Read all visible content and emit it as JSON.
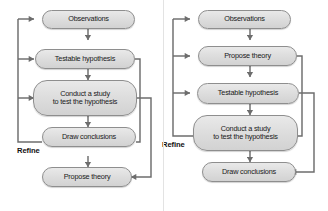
{
  "page": {
    "background_color": "#ffffff"
  },
  "style": {
    "node_fill": "#dedede",
    "node_border": "#8e8e8e",
    "edge_color": "#6d6d6d",
    "text_color": "#1a1a1a"
  },
  "diagrams": [
    {
      "id": "left",
      "name": "hypothesis-first-cycle",
      "refine_label": "Refine",
      "nodes": [
        {
          "id": "observations",
          "label": "Observations"
        },
        {
          "id": "testable",
          "label": "Testable hypothesis"
        },
        {
          "id": "conduct",
          "label": "Conduct a study\nto test the hypothesis"
        },
        {
          "id": "conclusions",
          "label": "Draw conclusions"
        },
        {
          "id": "propose",
          "label": "Propose theory"
        }
      ],
      "edges": [
        {
          "from": "observations",
          "to": "testable",
          "kind": "down"
        },
        {
          "from": "testable",
          "to": "conduct",
          "kind": "down"
        },
        {
          "from": "conduct",
          "to": "conclusions",
          "kind": "down"
        },
        {
          "from": "conclusions",
          "to": "propose",
          "kind": "down"
        },
        {
          "from": "conclusions",
          "to": "observations",
          "kind": "refine-left"
        },
        {
          "from": "conclusions",
          "to": "testable",
          "kind": "refine-left"
        },
        {
          "from": "conclusions",
          "to": "conduct",
          "kind": "refine-left"
        },
        {
          "from": "testable",
          "to": "conclusions",
          "kind": "feedback-right-inner"
        },
        {
          "from": "conduct",
          "to": "propose",
          "kind": "feedback-right-outer"
        }
      ]
    },
    {
      "id": "right",
      "name": "theory-first-cycle",
      "refine_label": "Refine",
      "nodes": [
        {
          "id": "observations",
          "label": "Observations"
        },
        {
          "id": "propose",
          "label": "Propose theory"
        },
        {
          "id": "testable",
          "label": "Testable hypothesis"
        },
        {
          "id": "conduct",
          "label": "Conduct a study\nto test the hypothesis"
        },
        {
          "id": "conclusions",
          "label": "Draw conclusions"
        }
      ],
      "edges": [
        {
          "from": "observations",
          "to": "propose",
          "kind": "down"
        },
        {
          "from": "propose",
          "to": "testable",
          "kind": "down"
        },
        {
          "from": "testable",
          "to": "conduct",
          "kind": "down"
        },
        {
          "from": "conduct",
          "to": "conclusions",
          "kind": "down"
        },
        {
          "from": "conduct",
          "to": "observations",
          "kind": "refine-left"
        },
        {
          "from": "conduct",
          "to": "propose",
          "kind": "refine-left"
        },
        {
          "from": "conduct",
          "to": "testable",
          "kind": "refine-left"
        },
        {
          "from": "propose",
          "to": "conduct",
          "kind": "feedback-right-inner"
        },
        {
          "from": "testable",
          "to": "conclusions",
          "kind": "feedback-right-outer"
        }
      ]
    }
  ]
}
